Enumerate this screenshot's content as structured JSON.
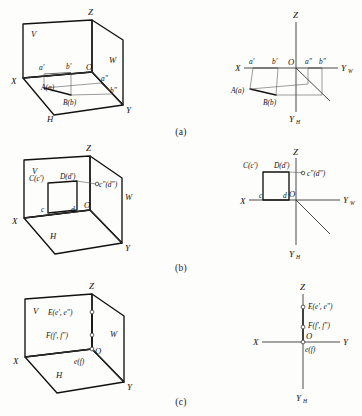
{
  "figure": {
    "paper_color": "#fdfdfb",
    "ink_color": "#111111",
    "panels": [
      {
        "id": "a",
        "caption": "(a)",
        "pictorial": {
          "planes": {
            "v": "V",
            "h": "H",
            "w": "W"
          },
          "axes": {
            "x": "X",
            "y": "Y",
            "z": "Z"
          },
          "origin": "O",
          "point_labels": [
            {
              "name": "a-prime",
              "text": "a'"
            },
            {
              "name": "b-prime",
              "text": "b'"
            },
            {
              "name": "a-double-prime",
              "text": "a\""
            },
            {
              "name": "b-double-prime",
              "text": "b\""
            },
            {
              "name": "point-A",
              "text": "A(a)"
            },
            {
              "name": "point-B",
              "text": "B(b)"
            }
          ]
        },
        "projection": {
          "axes": {
            "x": "X",
            "z": "Z",
            "yw": "Y",
            "yw_sub": "W",
            "yh": "Y",
            "yh_sub": "H"
          },
          "origin": "O",
          "point_labels": [
            {
              "name": "a-prime",
              "text": "a'"
            },
            {
              "name": "b-prime",
              "text": "b'"
            },
            {
              "name": "a-double-prime",
              "text": "a\""
            },
            {
              "name": "b-double-prime",
              "text": "b\""
            },
            {
              "name": "point-A",
              "text": "A(a)"
            },
            {
              "name": "point-B",
              "text": "B(b)"
            }
          ]
        }
      },
      {
        "id": "b",
        "caption": "(b)",
        "pictorial": {
          "planes": {
            "v": "V",
            "h": "H",
            "w": "W"
          },
          "axes": {
            "x": "X",
            "y": "Y",
            "z": "Z"
          },
          "origin": "O",
          "point_labels": [
            {
              "name": "point-C",
              "text": "C(c')"
            },
            {
              "name": "point-D",
              "text": "D(d')"
            },
            {
              "name": "c-double-prime",
              "text": "c\"(d\")"
            },
            {
              "name": "c-lower",
              "text": "c"
            },
            {
              "name": "d-lower",
              "text": "d"
            }
          ]
        },
        "projection": {
          "axes": {
            "x": "X",
            "z": "Z",
            "yw": "Y",
            "yw_sub": "W",
            "yh": "Y",
            "yh_sub": "H"
          },
          "origin": "O",
          "point_labels": [
            {
              "name": "point-C",
              "text": "C(c')"
            },
            {
              "name": "point-D",
              "text": "D(d')"
            },
            {
              "name": "c-double-prime",
              "text": "c\"(d\")"
            },
            {
              "name": "c-lower",
              "text": "c"
            },
            {
              "name": "d-lower",
              "text": "d"
            }
          ]
        }
      },
      {
        "id": "c",
        "caption": "(c)",
        "pictorial": {
          "planes": {
            "v": "V",
            "h": "H",
            "w": "W"
          },
          "axes": {
            "x": "X",
            "y": "Y",
            "z": "Z"
          },
          "origin": "O",
          "point_labels": [
            {
              "name": "point-E",
              "text": "E(e', e\")"
            },
            {
              "name": "point-F",
              "text": "F(f', f\")"
            },
            {
              "name": "ef-lower",
              "text": "e(f)"
            }
          ]
        },
        "projection": {
          "axes": {
            "x": "X",
            "z": "Z",
            "yw": "Y",
            "yh": "Y",
            "yh_sub": "H"
          },
          "origin": "O",
          "point_labels": [
            {
              "name": "point-E",
              "text": "E(e', e\")"
            },
            {
              "name": "point-F",
              "text": "F(f', f\")"
            },
            {
              "name": "ef-lower",
              "text": "e(f)"
            }
          ]
        }
      }
    ]
  }
}
